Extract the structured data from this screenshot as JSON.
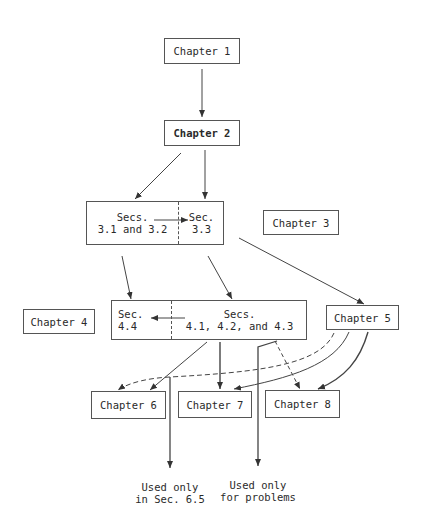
{
  "diagram": {
    "type": "chapter-dependency-flowchart",
    "nodes": {
      "ch1": {
        "label": "Chapter 1"
      },
      "ch2": {
        "label": "Chapter 2"
      },
      "sec3_left": {
        "label": "Secs.\n3.1 and 3.2"
      },
      "sec3_right": {
        "label": "Sec.\n3.3"
      },
      "ch3": {
        "label": "Chapter 3"
      },
      "ch4": {
        "label": "Chapter 4"
      },
      "sec4_left": {
        "label": "Sec.\n4.4"
      },
      "sec4_right": {
        "label": "Secs.\n4.1, 4.2, and 4.3"
      },
      "ch5": {
        "label": "Chapter 5"
      },
      "ch6": {
        "label": "Chapter 6"
      },
      "ch7": {
        "label": "Chapter 7"
      },
      "ch8": {
        "label": "Chapter 8"
      }
    },
    "notes": {
      "sec65": "Used only\nin Sec. 6.5",
      "problems": "Used only\nfor problems"
    },
    "edges": [
      {
        "from": "Chapter 1",
        "to": "Chapter 2",
        "style": "solid"
      },
      {
        "from": "Chapter 2",
        "to": "Secs. 3.1 and 3.2",
        "style": "solid"
      },
      {
        "from": "Chapter 2",
        "to": "Sec. 3.3",
        "style": "solid"
      },
      {
        "from": "Secs. 3.1 and 3.2",
        "to": "Sec. 3.3",
        "style": "solid"
      },
      {
        "from": "Secs. 3.1 and 3.2",
        "to": "Sec. 4.4",
        "style": "solid"
      },
      {
        "from": "Sec. 3.3",
        "to": "Secs. 4.1, 4.2, and 4.3",
        "style": "solid"
      },
      {
        "from": "Sec. 3.3",
        "to": "Chapter 5",
        "style": "solid"
      },
      {
        "from": "Secs. 4.1, 4.2, and 4.3",
        "to": "Sec. 4.4",
        "style": "solid"
      },
      {
        "from": "Secs. 4.1, 4.2, and 4.3",
        "to": "Chapter 6",
        "style": "solid"
      },
      {
        "from": "Secs. 4.1, 4.2, and 4.3",
        "to": "Chapter 7",
        "style": "solid"
      },
      {
        "from": "Secs. 4.1, 4.2, and 4.3",
        "to": "Chapter 8",
        "style": "dashed"
      },
      {
        "from": "Chapter 5",
        "to": "Chapter 6",
        "style": "dashed"
      },
      {
        "from": "Chapter 5",
        "to": "Chapter 7",
        "style": "solid"
      },
      {
        "from": "Chapter 5",
        "to": "Chapter 8",
        "style": "solid"
      },
      {
        "from": "Chapter 5 dashed branch",
        "to": "Used only in Sec. 6.5",
        "style": "solid"
      },
      {
        "from": "Secs. 4.1, 4.2, and 4.3",
        "to": "Used only for problems",
        "style": "solid"
      }
    ]
  },
  "colors": {
    "line": "#444444",
    "box_border": "#555555",
    "text": "#2a2a2a",
    "background": "#ffffff"
  }
}
